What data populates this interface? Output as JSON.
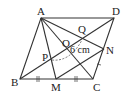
{
  "diagram": {
    "points": {
      "A": {
        "label": "A",
        "x": 41,
        "y": 18
      },
      "D": {
        "label": "D",
        "x": 114,
        "y": 18
      },
      "B": {
        "label": "B",
        "x": 20,
        "y": 79
      },
      "C": {
        "label": "C",
        "x": 93,
        "y": 79
      },
      "M": {
        "label": "M",
        "x": 56,
        "y": 79
      },
      "N": {
        "label": "N",
        "x": 104,
        "y": 49
      },
      "O": {
        "label": "O",
        "x": 67,
        "y": 48
      },
      "P": {
        "label": "P",
        "x": 52,
        "y": 60
      },
      "Q": {
        "label": "Q",
        "x": 83,
        "y": 38
      }
    },
    "segments": [
      "AB",
      "BC",
      "CD",
      "DA",
      "AC",
      "BD",
      "AM",
      "AN",
      "MN"
    ],
    "measure_label": "6 cm",
    "measure_between": "PQ",
    "equal_marks": [
      "BM",
      "MC"
    ]
  }
}
